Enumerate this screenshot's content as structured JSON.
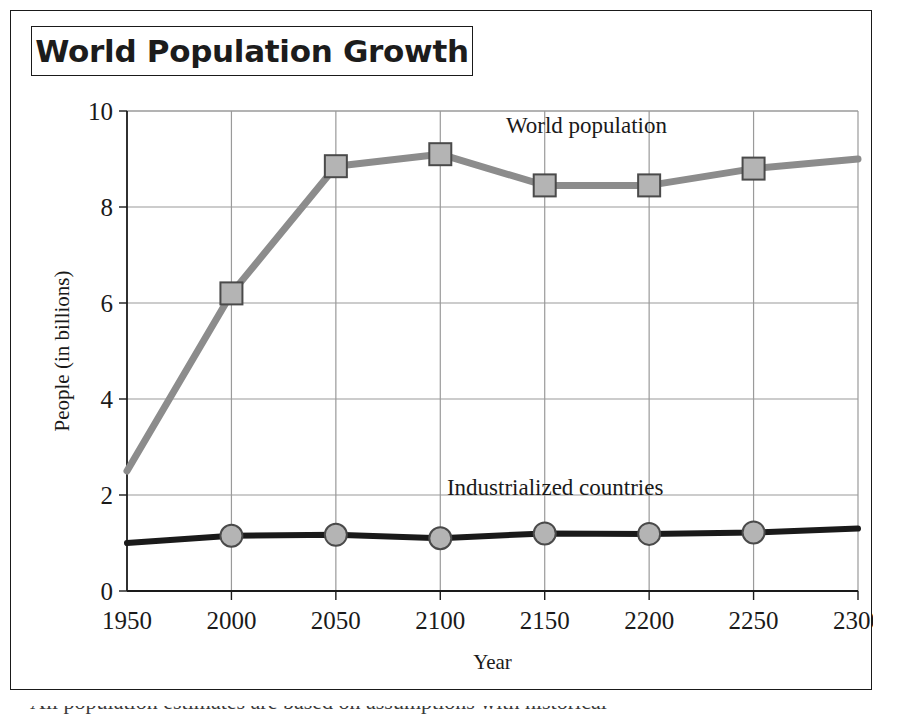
{
  "figure": {
    "title": "World Population Growth"
  },
  "chart_data": {
    "type": "line",
    "title": "World Population Growth",
    "xlabel": "Year",
    "ylabel": "People (in billions)",
    "xlim": [
      1950,
      2300
    ],
    "ylim": [
      0,
      10
    ],
    "xticks": [
      "1950",
      "2000",
      "2050",
      "2100",
      "2150",
      "2200",
      "2250",
      "2300"
    ],
    "yticks": [
      "0",
      "2",
      "4",
      "6",
      "8",
      "10"
    ],
    "grid": true,
    "legend": "inline-labels",
    "x": [
      1950,
      2000,
      2050,
      2100,
      2150,
      2200,
      2250,
      2300
    ],
    "series": [
      {
        "name": "World population",
        "values": [
          2.5,
          6.2,
          8.85,
          9.1,
          8.45,
          8.45,
          8.8,
          9.0
        ],
        "color": "#8c8c8c",
        "marker": "square",
        "marker_at": [
          2000,
          2050,
          2100,
          2150,
          2200,
          2250
        ],
        "label_text": "World population",
        "label_x": 2170,
        "label_y": 9.55
      },
      {
        "name": "Industrialized countries",
        "values": [
          1.0,
          1.15,
          1.17,
          1.1,
          1.2,
          1.19,
          1.22,
          1.3
        ],
        "color": "#1a1a1a",
        "marker": "circle",
        "marker_at": [
          2000,
          2050,
          2100,
          2150,
          2200,
          2250
        ],
        "label_text": "Industrialized countries",
        "label_x": 2155,
        "label_y": 2.0
      }
    ]
  }
}
